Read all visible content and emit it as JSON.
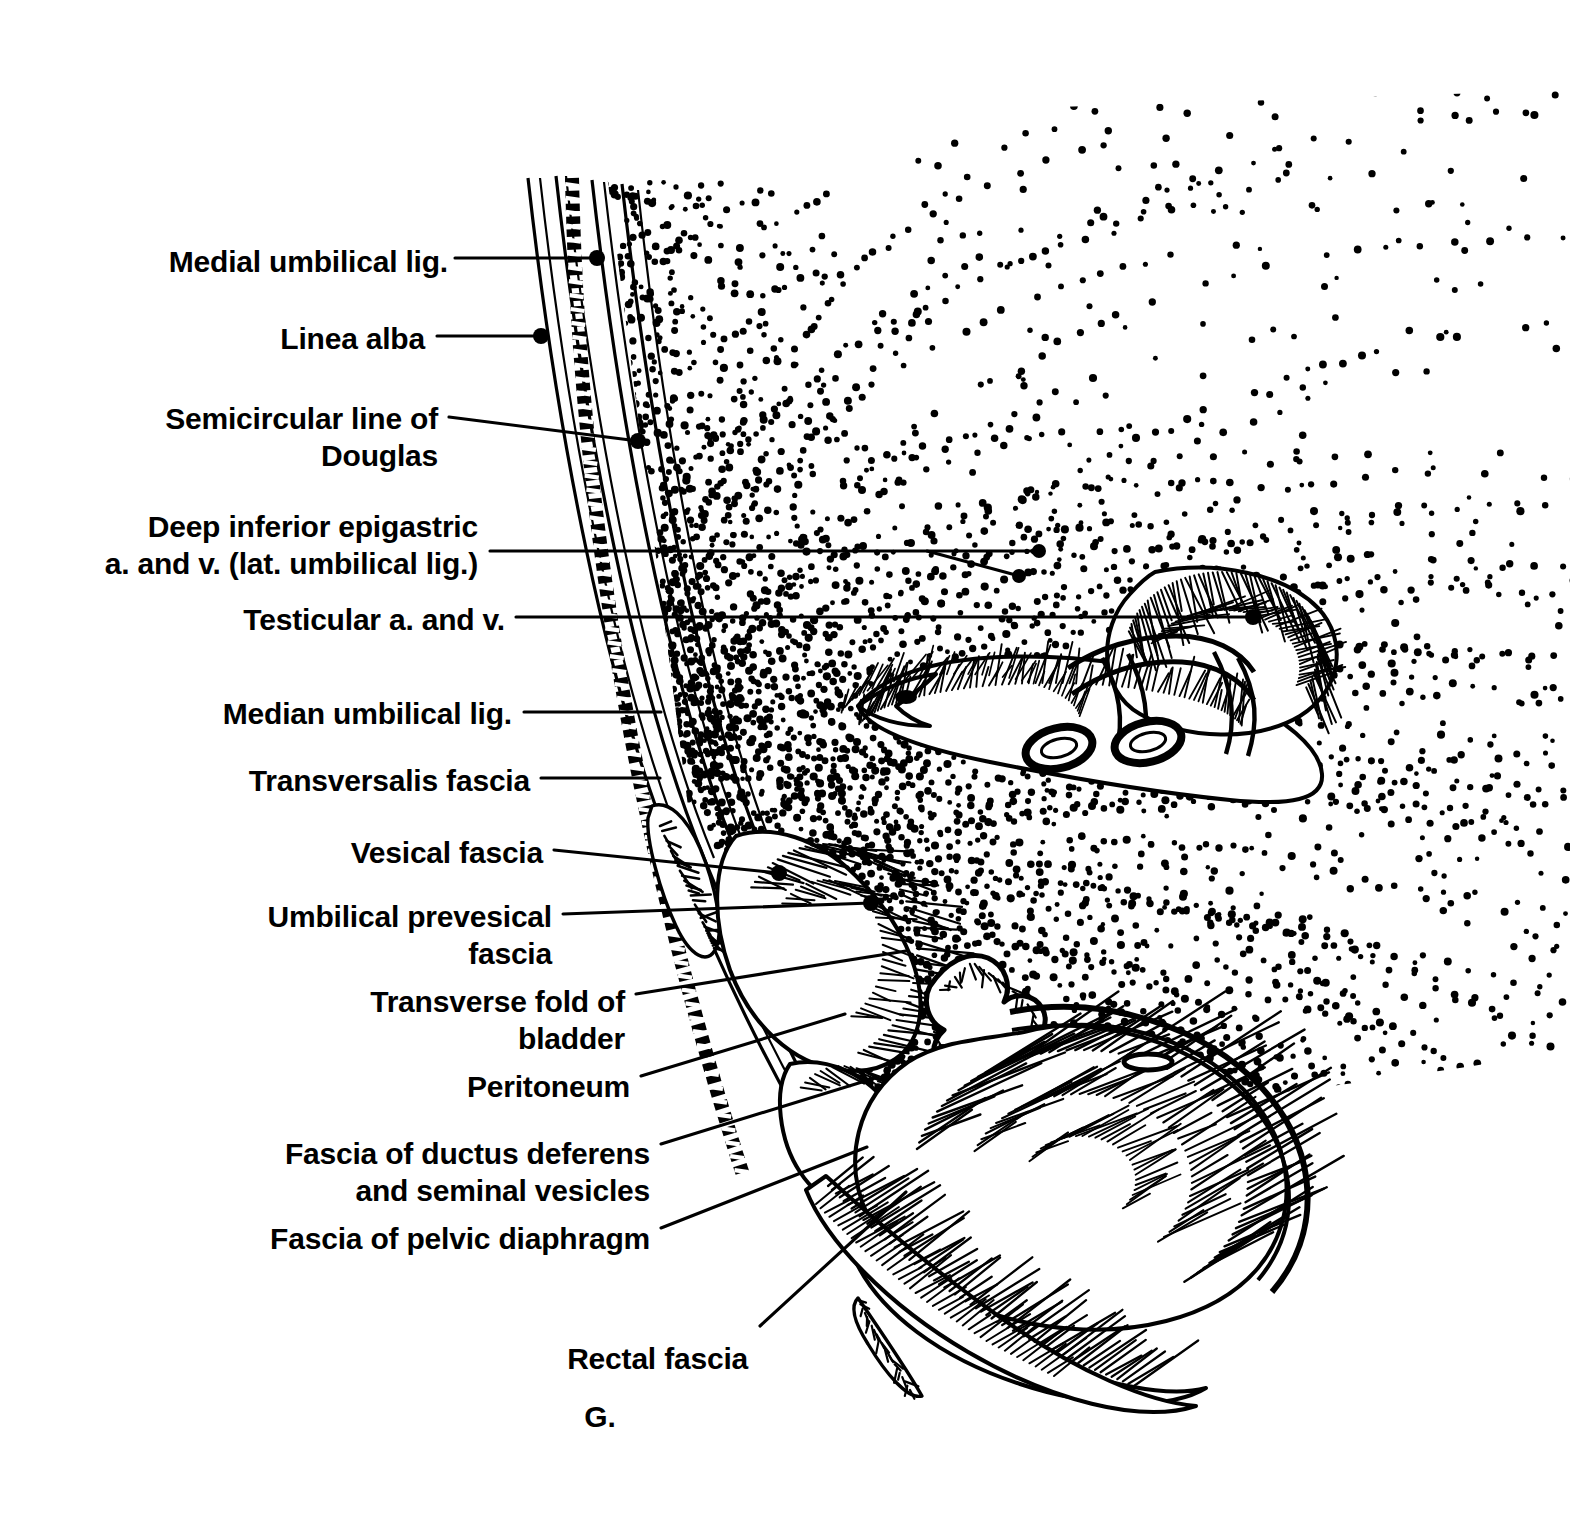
{
  "figure": {
    "panel_letter": "G.",
    "style": "black-and-white pen-and-ink line drawing with stipple shading",
    "background_color": "#ffffff",
    "ink_color": "#000000"
  },
  "labels": [
    {
      "id": "medial-umbilical-lig",
      "text": "Medial umbilical lig.",
      "lines": [
        "Medial umbilical lig."
      ],
      "align": "right",
      "x": 448,
      "y": 243,
      "leader": {
        "type": "dot",
        "from_x": 455,
        "from_y": 258,
        "to_x": 597,
        "to_y": 258,
        "bend_x": null,
        "bend_y": null
      }
    },
    {
      "id": "linea-alba",
      "text": "Linea alba",
      "lines": [
        "Linea alba"
      ],
      "align": "right",
      "x": 425,
      "y": 320,
      "leader": {
        "type": "dot",
        "from_x": 437,
        "from_y": 336,
        "to_x": 541,
        "to_y": 336,
        "bend_x": null,
        "bend_y": null
      }
    },
    {
      "id": "semicircular-line-douglas",
      "text": "Semicircular line of Douglas",
      "lines": [
        "Semicircular line of",
        "Douglas"
      ],
      "align": "right",
      "x": 438,
      "y": 400,
      "leader": {
        "type": "dot",
        "from_x": 449,
        "from_y": 417,
        "to_x": 638,
        "to_y": 441,
        "bend_x": null,
        "bend_y": null
      }
    },
    {
      "id": "deep-inferior-epigastric",
      "text": "Deep inferior epigastric a. and v. (lat. umbilical lig.)",
      "lines": [
        "Deep inferior epigastric",
        "a. and v. (lat. umbilical lig.)"
      ],
      "align": "right",
      "x": 478,
      "y": 508,
      "leader": {
        "type": "fork",
        "from_x": 490,
        "from_y": 551,
        "to_x": 1039,
        "to_y": 551,
        "bend_x": 927,
        "bend_y": 551,
        "to2_x": 1019,
        "to2_y": 576
      }
    },
    {
      "id": "testicular-a-and-v",
      "text": "Testicular a. and v.",
      "lines": [
        "Testicular a. and v."
      ],
      "align": "right",
      "x": 505,
      "y": 601,
      "leader": {
        "type": "dot",
        "from_x": 516,
        "from_y": 617,
        "to_x": 1253,
        "to_y": 617,
        "bend_x": null,
        "bend_y": null
      }
    },
    {
      "id": "median-umbilical-lig",
      "text": "Median umbilical lig.",
      "lines": [
        "Median umbilical lig."
      ],
      "align": "right",
      "x": 512,
      "y": 695,
      "leader": {
        "type": "plain",
        "from_x": 524,
        "from_y": 712,
        "to_x": 661,
        "to_y": 712,
        "bend_x": null,
        "bend_y": null
      }
    },
    {
      "id": "transversalis-fascia",
      "text": "Transversalis fascia",
      "lines": [
        "Transversalis fascia"
      ],
      "align": "right",
      "x": 530,
      "y": 762,
      "leader": {
        "type": "plain",
        "from_x": 541,
        "from_y": 778,
        "to_x": 660,
        "to_y": 778,
        "bend_x": null,
        "bend_y": null
      }
    },
    {
      "id": "vesical-fascia",
      "text": "Vesical fascia",
      "lines": [
        "Vesical fascia"
      ],
      "align": "right",
      "x": 543,
      "y": 834,
      "leader": {
        "type": "dot",
        "from_x": 554,
        "from_y": 850,
        "to_x": 779,
        "to_y": 873,
        "bend_x": null,
        "bend_y": null
      }
    },
    {
      "id": "umbilical-prevesical-fascia",
      "text": "Umbilical prevesical fascia",
      "lines": [
        "Umbilical prevesical",
        "fascia"
      ],
      "align": "right",
      "x": 552,
      "y": 898,
      "leader": {
        "type": "dot",
        "from_x": 563,
        "from_y": 914,
        "to_x": 871,
        "to_y": 903,
        "bend_x": null,
        "bend_y": null
      }
    },
    {
      "id": "transverse-fold-bladder",
      "text": "Transverse fold of bladder",
      "lines": [
        "Transverse fold of",
        "bladder"
      ],
      "align": "right",
      "x": 625,
      "y": 983,
      "leader": {
        "type": "plain",
        "from_x": 636,
        "from_y": 994,
        "to_x": 906,
        "to_y": 951,
        "bend_x": null,
        "bend_y": null
      }
    },
    {
      "id": "peritoneum",
      "text": "Peritoneum",
      "lines": [
        "Peritoneum"
      ],
      "align": "right",
      "x": 630,
      "y": 1068,
      "leader": {
        "type": "plain",
        "from_x": 641,
        "from_y": 1076,
        "to_x": 845,
        "to_y": 1014,
        "bend_x": null,
        "bend_y": null
      }
    },
    {
      "id": "fascia-ductus-deferens",
      "text": "Fascia of ductus deferens and seminal vesicles",
      "lines": [
        "Fascia of ductus deferens",
        "and seminal vesicles"
      ],
      "align": "right",
      "x": 650,
      "y": 1135,
      "leader": {
        "type": "plain",
        "from_x": 661,
        "from_y": 1144,
        "to_x": 875,
        "to_y": 1078,
        "bend_x": null,
        "bend_y": null
      }
    },
    {
      "id": "fascia-pelvic-diaphragm",
      "text": "Fascia of pelvic diaphragm",
      "lines": [
        "Fascia of pelvic diaphragm"
      ],
      "align": "right",
      "x": 650,
      "y": 1220,
      "leader": {
        "type": "plain",
        "from_x": 661,
        "from_y": 1228,
        "to_x": 867,
        "to_y": 1147,
        "bend_x": null,
        "bend_y": null
      }
    },
    {
      "id": "rectal-fascia",
      "text": "Rectal fascia",
      "lines": [
        "Rectal fascia"
      ],
      "align": "right",
      "x": 748,
      "y": 1340,
      "leader": {
        "type": "plain",
        "from_x": 760,
        "from_y": 1326,
        "to_x": 906,
        "to_y": 1192,
        "bend_x": null,
        "bend_y": null
      }
    }
  ],
  "panel_letter_pos": {
    "x": 600,
    "y": 1398
  },
  "structures": [
    {
      "name": "anterior-abdominal-wall",
      "note": "layered curved fascial planes descending from upper left"
    },
    {
      "name": "linea-alba-band",
      "note": "dark dashed vertical band within the wall"
    },
    {
      "name": "spermatic-cord-inguinal-canal",
      "note": "upper right oblong structure with vessels and ducts in cross section"
    },
    {
      "name": "bladder-and-seminal-vesicles",
      "note": "mid-lower region of folded viscera"
    },
    {
      "name": "rectum",
      "note": "large lower-right organ with longitudinal striations"
    },
    {
      "name": "pelvic-diaphragm",
      "note": "hatched sheet beneath rectum"
    },
    {
      "name": "stipple-shading",
      "note": "radiating dotted fascial planes filling the right field"
    }
  ]
}
